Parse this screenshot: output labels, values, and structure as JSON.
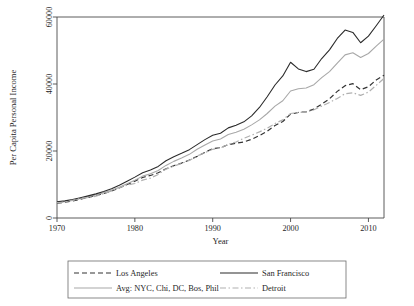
{
  "chart_data": {
    "type": "line",
    "title": "",
    "xlabel": "Year",
    "ylabel": "Per Capita Personal Income",
    "xlim": [
      1970,
      2012
    ],
    "ylim": [
      0,
      60000
    ],
    "xticks": [
      1970,
      1980,
      1990,
      2000,
      2010
    ],
    "xtick_labels": [
      "1970",
      "1980",
      "1990",
      "2000",
      "2010"
    ],
    "yticks": [
      0,
      20000,
      40000,
      60000
    ],
    "ytick_labels": [
      "0",
      "20000",
      "40000",
      "60000"
    ],
    "grid": false,
    "legend_position": "below-plot",
    "x": [
      1970,
      1971,
      1972,
      1973,
      1974,
      1975,
      1976,
      1977,
      1978,
      1979,
      1980,
      1981,
      1982,
      1983,
      1984,
      1985,
      1986,
      1987,
      1988,
      1989,
      1990,
      1991,
      1992,
      1993,
      1994,
      1995,
      1996,
      1997,
      1998,
      1999,
      2000,
      2001,
      2002,
      2003,
      2004,
      2005,
      2006,
      2007,
      2008,
      2009,
      2010,
      2011,
      2012
    ],
    "series": [
      {
        "name": "Los Angeles",
        "color": "#333333",
        "dash": "dashed",
        "values": [
          4450,
          4700,
          5100,
          5600,
          6150,
          6700,
          7350,
          8050,
          9000,
          10000,
          11000,
          12100,
          12700,
          13500,
          14700,
          15600,
          16400,
          17300,
          18400,
          19600,
          20700,
          21000,
          21900,
          22300,
          22700,
          23500,
          24600,
          25900,
          27600,
          28800,
          31000,
          31500,
          31700,
          32500,
          34000,
          35600,
          37800,
          39500,
          40100,
          38300,
          39200,
          41200,
          42600
        ]
      },
      {
        "name": "Avg: NYC, Chi, DC, Bos, Phil",
        "color": "#a8a8a8",
        "dash": "solid",
        "values": [
          4600,
          4900,
          5300,
          5850,
          6350,
          6900,
          7550,
          8250,
          9200,
          10250,
          11300,
          12500,
          13200,
          14200,
          15700,
          16900,
          17900,
          19000,
          20500,
          21800,
          23000,
          23600,
          24900,
          25600,
          26500,
          27800,
          29300,
          31200,
          33400,
          35000,
          37900,
          38600,
          38800,
          39800,
          41900,
          43700,
          46200,
          48700,
          49300,
          47900,
          49100,
          51300,
          53400
        ]
      },
      {
        "name": "San Francisco",
        "color": "#2b2b2b",
        "dash": "solid",
        "values": [
          4800,
          5100,
          5500,
          6050,
          6600,
          7200,
          7900,
          8700,
          9800,
          11000,
          12200,
          13500,
          14300,
          15400,
          17100,
          18300,
          19300,
          20400,
          21900,
          23400,
          24700,
          25300,
          26900,
          27700,
          28700,
          30500,
          33000,
          36200,
          39700,
          42400,
          46500,
          44500,
          43700,
          44400,
          47600,
          50200,
          53600,
          56100,
          55400,
          52300,
          54300,
          57400,
          60600
        ]
      },
      {
        "name": "Detroit",
        "color": "#b0b0b0",
        "dash": "dashdot",
        "values": [
          4550,
          4800,
          5250,
          5800,
          6100,
          6500,
          7250,
          8100,
          9050,
          9800,
          10300,
          11300,
          11900,
          13000,
          14600,
          15500,
          16300,
          17200,
          18500,
          19500,
          20500,
          20900,
          22000,
          22700,
          23800,
          24700,
          25700,
          26800,
          28200,
          29300,
          31200,
          31500,
          31600,
          32300,
          33400,
          34500,
          35700,
          37100,
          37400,
          36600,
          37600,
          39600,
          41700
        ]
      }
    ]
  },
  "legend": {
    "entries": [
      {
        "label": "Los Angeles",
        "style": "dashed",
        "color": "#333333"
      },
      {
        "label": "San Francisco",
        "style": "solid",
        "color": "#2b2b2b"
      },
      {
        "label": "Avg: NYC, Chi, DC, Bos, Phil",
        "style": "solid",
        "color": "#a8a8a8"
      },
      {
        "label": "Detroit",
        "style": "dashdot",
        "color": "#b0b0b0"
      }
    ]
  }
}
